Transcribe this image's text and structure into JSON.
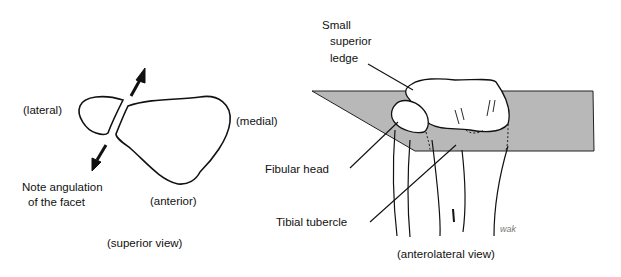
{
  "superior_view": {
    "caption": "(superior view)",
    "labels": {
      "lateral": "(lateral)",
      "medial": "(medial)",
      "anterior": "(anterior)",
      "note_line1": "Note angulation",
      "note_line2": "of the facet"
    }
  },
  "anterolateral_view": {
    "caption": "(anterolateral view)",
    "labels": {
      "ledge_line1": "Small",
      "ledge_line2": "superior",
      "ledge_line3": "ledge",
      "fibular_head": "Fibular head",
      "tibial_tubercle": "Tibial tubercle"
    },
    "signature": "wak",
    "plane_color": "#b8b8b8"
  }
}
